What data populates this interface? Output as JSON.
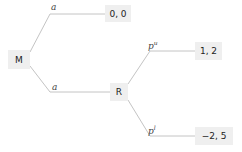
{
  "tree": {
    "root": {
      "label": "M"
    },
    "nodes": [
      {
        "id": "R",
        "label": "R"
      }
    ],
    "edges": [
      {
        "from": "M",
        "to": "payoff_top",
        "label": "a"
      },
      {
        "from": "M",
        "to": "R",
        "label": "a"
      },
      {
        "from": "R",
        "to": "payoff_mid",
        "label_base": "p",
        "label_sup": "u"
      },
      {
        "from": "R",
        "to": "payoff_bottom",
        "label_base": "p",
        "label_sup": "l"
      }
    ],
    "payoffs": [
      {
        "id": "payoff_top",
        "value": "0, 0"
      },
      {
        "id": "payoff_mid",
        "value": "1, 2"
      },
      {
        "id": "payoff_bottom",
        "value": "−2, 5"
      }
    ]
  },
  "colors": {
    "edge": "#bfbfbf",
    "node_bg": "#efefef",
    "text": "#222222"
  }
}
